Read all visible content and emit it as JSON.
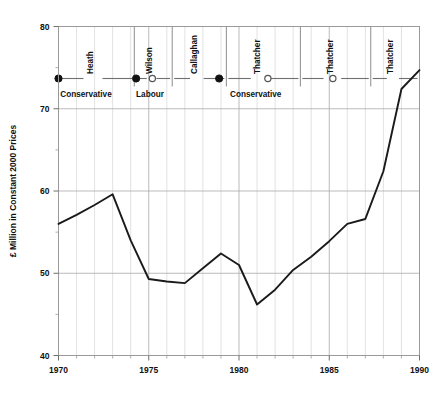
{
  "chart_data": {
    "type": "line",
    "title": "",
    "xlabel": "",
    "ylabel": "£ Million in Constant 2000 Prices",
    "xlim": [
      1970,
      1990
    ],
    "ylim": [
      40,
      80
    ],
    "grid": true,
    "legend": "none",
    "x": [
      1970,
      1971,
      1972,
      1973,
      1974,
      1975,
      1976,
      1977,
      1978,
      1979,
      1980,
      1981,
      1982,
      1983,
      1984,
      1985,
      1986,
      1987,
      1988,
      1989,
      1990
    ],
    "values": [
      56.0,
      57.1,
      58.3,
      59.6,
      54.0,
      49.3,
      49.0,
      48.8,
      50.6,
      52.4,
      51.0,
      46.2,
      48.0,
      50.4,
      52.0,
      53.9,
      56.0,
      56.6,
      62.4,
      72.4,
      74.7
    ],
    "series": [
      {
        "name": "UK expenditure",
        "values": [
          56.0,
          57.1,
          58.3,
          59.6,
          54.0,
          49.3,
          49.0,
          48.8,
          50.6,
          52.4,
          51.0,
          46.2,
          48.0,
          50.4,
          52.0,
          53.9,
          56.0,
          56.6,
          62.4,
          72.4,
          74.7
        ]
      }
    ],
    "y_ticks": [
      40,
      50,
      60,
      70,
      80
    ],
    "y_tick_labels": [
      "40",
      "50",
      "60",
      "70",
      "80"
    ],
    "y_minor_ticks": [
      45,
      55,
      65,
      75
    ],
    "x_ticks": [
      1970,
      1975,
      1980,
      1985,
      1990
    ],
    "x_tick_labels": [
      "1970",
      "1975",
      "1980",
      "1985",
      "1990"
    ],
    "annotations": {
      "description": "Prime-ministerial terms shown as horizontal segments along the top of the plot, separated by vertical divider lines, with party names beneath.",
      "pm_terms": [
        {
          "name": "Heath",
          "start": 1970.0,
          "end": 1974.2,
          "marker": "filled",
          "marker_x": 1970.0
        },
        {
          "name": "Wilson",
          "start": 1974.2,
          "end": 1976.3,
          "marker": "filled",
          "marker_x": 1974.3
        },
        {
          "name": "Callaghan",
          "start": 1976.3,
          "end": 1979.3,
          "marker": "open",
          "marker_x": 1975.2
        },
        {
          "name": "Thatcher",
          "start": 1979.3,
          "end": 1983.4,
          "marker": "filled",
          "marker_x": 1978.9
        },
        {
          "name": "Thatcher",
          "start": 1983.4,
          "end": 1987.3,
          "marker": "open",
          "marker_x": 1981.6
        },
        {
          "name": "Thatcher",
          "start": 1987.3,
          "end": 1990.0,
          "marker": "open",
          "marker_x": 1985.2
        }
      ],
      "party_labels": [
        {
          "label": "Conservative",
          "x": 1970.1
        },
        {
          "label": "Labour",
          "x": 1974.3
        },
        {
          "label": "Conservative",
          "x": 1979.5
        }
      ],
      "dividers": [
        1974.2,
        1976.3,
        1979.3,
        1983.4,
        1987.3
      ],
      "marker_legend": {
        "filled": "Conservative government",
        "open": "election / term marker"
      }
    }
  }
}
